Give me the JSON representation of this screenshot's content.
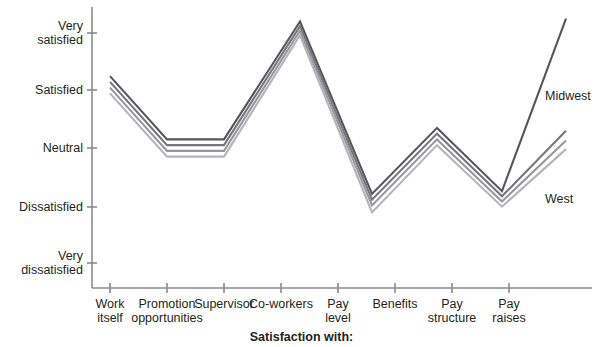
{
  "chart_data": {
    "type": "line",
    "title": "",
    "xlabel": "Satisfaction with:",
    "ylabel": "",
    "grid": false,
    "legend_position": "right-inline",
    "categories": [
      "Work itself",
      "Promotion opportunities",
      "Supervisor",
      "Co-workers",
      "Pay level",
      "Benefits",
      "Pay structure",
      "Pay raises"
    ],
    "ytick_labels": [
      "Very satisfied",
      "Satisfied",
      "Neutral",
      "Dissatisfied",
      "Very dissatisfied"
    ],
    "yticks": [
      5,
      4,
      3,
      2,
      1
    ],
    "ylim": [
      0.6,
      5.3
    ],
    "series": [
      {
        "name": "Midwest",
        "color": "#56565a",
        "values": [
          4.25,
          3.15,
          3.15,
          5.2,
          2.2,
          3.35,
          2.25,
          5.25
        ]
      },
      {
        "name": "Series 2",
        "color": "#76767a",
        "values": [
          4.15,
          3.05,
          3.05,
          5.12,
          2.1,
          3.25,
          2.16,
          3.3
        ]
      },
      {
        "name": "Series 3",
        "color": "#97979b",
        "values": [
          4.05,
          2.95,
          2.95,
          5.04,
          2.0,
          3.15,
          2.07,
          3.13
        ]
      },
      {
        "name": "West",
        "color": "#b4b4b8",
        "values": [
          3.95,
          2.85,
          2.85,
          4.96,
          1.88,
          3.05,
          1.98,
          2.98
        ]
      }
    ],
    "annotations": [
      {
        "text": "Midwest",
        "x": 545,
        "y": 89
      },
      {
        "text": "West",
        "x": 545,
        "y": 192
      }
    ],
    "axis_color": "#8b8b8f"
  },
  "ytick_labels_split": [
    {
      "line1": "Very",
      "line2": "satisfied"
    },
    {
      "line1": "Satisfied",
      "line2": ""
    },
    {
      "line1": "Neutral",
      "line2": ""
    },
    {
      "line1": "Dissatisfied",
      "line2": ""
    },
    {
      "line1": "Very",
      "line2": "dissatisfied"
    }
  ],
  "xtick_labels_split": [
    {
      "line1": "Work",
      "line2": "itself"
    },
    {
      "line1": "Promotion",
      "line2": "opportunities"
    },
    {
      "line1": "Supervisor",
      "line2": ""
    },
    {
      "line1": "Co-workers",
      "line2": ""
    },
    {
      "line1": "Pay",
      "line2": "level"
    },
    {
      "line1": "Benefits",
      "line2": ""
    },
    {
      "line1": "Pay",
      "line2": "structure"
    },
    {
      "line1": "Pay",
      "line2": "raises"
    }
  ],
  "axis_title": {
    "text": "Satisfaction with:"
  },
  "series_labels": [
    {
      "text": "Midwest"
    },
    {
      "text": "West"
    }
  ]
}
